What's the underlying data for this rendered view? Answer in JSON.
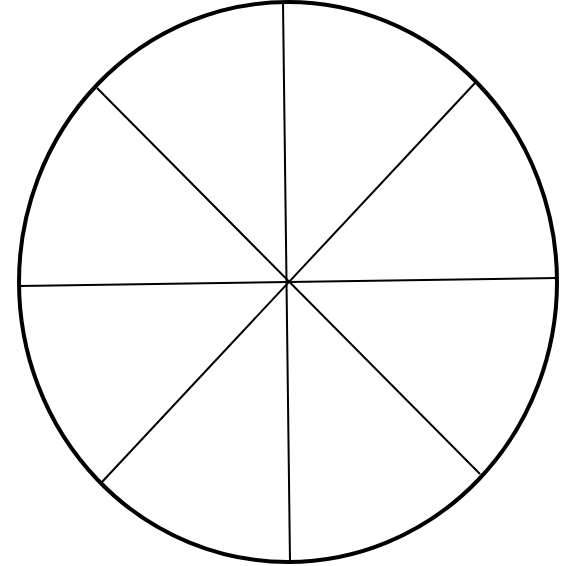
{
  "diagram": {
    "type": "divided-circle",
    "sectors": 8,
    "stroke_color": "#000000",
    "background_color": "#ffffff",
    "outline": {
      "cx": 288,
      "cy": 282,
      "rx": 269,
      "ry": 280,
      "stroke_width": 4
    },
    "lines": [
      {
        "name": "vertical-line",
        "x1": 283,
        "y1": 3,
        "x2": 290,
        "y2": 561
      },
      {
        "name": "horizontal-line",
        "x1": 20,
        "y1": 286,
        "x2": 557,
        "y2": 278
      },
      {
        "name": "diagonal-line-a",
        "x1": 97,
        "y1": 88,
        "x2": 480,
        "y2": 474
      },
      {
        "name": "diagonal-line-b",
        "x1": 475,
        "y1": 83,
        "x2": 102,
        "y2": 482
      }
    ]
  }
}
